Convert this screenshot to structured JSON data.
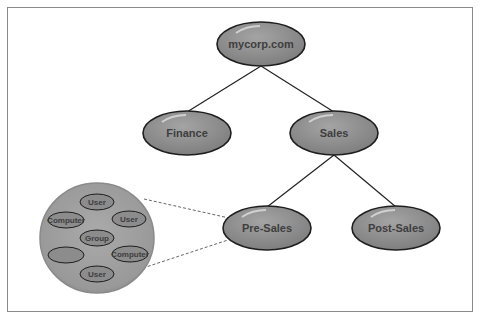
{
  "diagram": {
    "type": "hierarchy-tree",
    "root": {
      "label": "mycorp.com"
    },
    "level1": [
      {
        "label": "Finance"
      },
      {
        "label": "Sales"
      }
    ],
    "level2": [
      {
        "label": "Pre-Sales"
      },
      {
        "label": "Post-Sales"
      }
    ],
    "detail": {
      "description": "expanded view of Pre-Sales",
      "items": [
        {
          "label": "User"
        },
        {
          "label": "Computer"
        },
        {
          "label": "User"
        },
        {
          "label": "Group"
        },
        {
          "label": ""
        },
        {
          "label": "Computer"
        },
        {
          "label": "User"
        }
      ]
    },
    "colors": {
      "node_fill": "#8c8c8c",
      "node_stroke": "#1e1e1e",
      "container_fill": "#9a9a9a",
      "text": "#3e3e3e",
      "line": "#222222"
    }
  }
}
